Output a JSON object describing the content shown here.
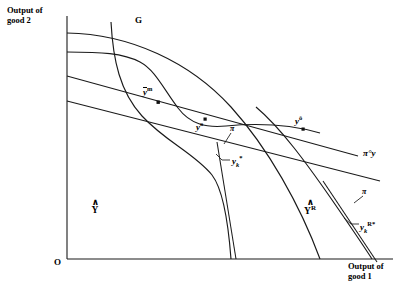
{
  "figure": {
    "title_present": false,
    "background": "#ffffff",
    "stroke": "#1a1a1a",
    "width": 400,
    "height": 291
  },
  "axes": {
    "y_axis_label_line1": "Output of",
    "y_axis_label_line2": "good 2",
    "x_axis_label_line1": "Output of",
    "x_axis_label_line2": "good 1",
    "origin_label": "O"
  },
  "curves": {
    "frontier_label": "G",
    "price_line_label_pi": "π",
    "price_line_label_pi_o_y": "π°y"
  },
  "points": [
    {
      "name": "y-bar-m",
      "base": "y",
      "sup": "m",
      "overbar": true,
      "label_x": 143,
      "label_y": 88,
      "dot_x": 159,
      "dot_y": 102
    },
    {
      "name": "y-o",
      "base": "y",
      "sup": "o",
      "overbar": false,
      "label_x": 199,
      "label_y": 122,
      "dot_x": 205,
      "dot_y": 120
    },
    {
      "name": "y-hat-o",
      "base": "y",
      "sup": "ô",
      "overbar": false,
      "label_x": 296,
      "label_y": 116,
      "dot_x": 303,
      "dot_y": 129
    },
    {
      "name": "y-k-star",
      "base": "y",
      "sub": "k",
      "sup": "*",
      "overbar": false,
      "label_x": 233,
      "label_y": 156
    },
    {
      "name": "y-k-R-star",
      "base": "y",
      "sub": "k",
      "sup": "R*",
      "overbar": false,
      "label_x": 361,
      "label_y": 222
    }
  ],
  "regions": [
    {
      "name": "Y-hat",
      "hat": "∧",
      "base": "Y",
      "sup": "",
      "x": 93,
      "y": 203
    },
    {
      "name": "Y-hat-R",
      "hat": "∧",
      "base": "Y",
      "sup": "R",
      "x": 309,
      "y": 203
    }
  ],
  "annotations": {
    "pi_near_yk_star": "π",
    "pi_near_yk_R_star": "π"
  }
}
